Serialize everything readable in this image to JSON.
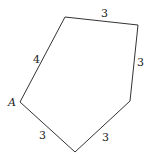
{
  "diagram": {
    "type": "pentagon",
    "vertices": [
      {
        "name": "A",
        "x": 20,
        "y": 102,
        "label": "A"
      },
      {
        "name": "bottom",
        "x": 75,
        "y": 152,
        "label": ""
      },
      {
        "name": "right-lower",
        "x": 130,
        "y": 101,
        "label": ""
      },
      {
        "name": "right-upper",
        "x": 138,
        "y": 25,
        "label": ""
      },
      {
        "name": "top-left",
        "x": 65,
        "y": 17,
        "label": ""
      }
    ],
    "sides": [
      {
        "name": "side-a-bottom",
        "label": "3",
        "lx": 42,
        "ly": 136
      },
      {
        "name": "side-bottom-rightlower",
        "label": "3",
        "lx": 104,
        "ly": 137
      },
      {
        "name": "side-rightlower-rightupper",
        "label": "3",
        "lx": 140,
        "ly": 66
      },
      {
        "name": "side-rightupper-topleft",
        "label": "3",
        "lx": 104,
        "ly": 17
      },
      {
        "name": "side-topleft-a",
        "label": "4",
        "lx": 36,
        "ly": 60
      }
    ],
    "stroke_color": "#333333"
  }
}
